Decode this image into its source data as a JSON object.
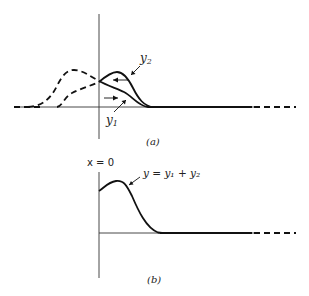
{
  "figure_a": {
    "caption": "(a)",
    "label_y2": "y",
    "label_y2_sub": "2",
    "label_y1": "y",
    "label_y1_sub": "1",
    "description": "Two wave pulses y1 (moving right) and y2 (moving left) shown solid and dashed, overlapping near x = 0"
  },
  "figure_b": {
    "caption": "(b)",
    "axis_label": "x = 0",
    "curve_label": "y = y₁ + y₂",
    "description": "Resultant y = y1 + y2 to the right of x = 0"
  },
  "colors": {
    "line": "#111111",
    "axis": "#333333",
    "background": "#ffffff"
  }
}
